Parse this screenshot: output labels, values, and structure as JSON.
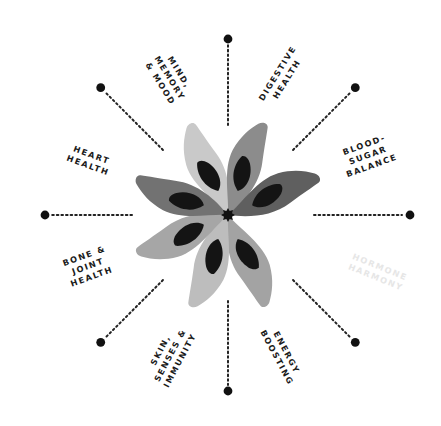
{
  "diagram": {
    "center": [
      228,
      215
    ],
    "spokes": [
      {
        "id": "digestive",
        "angle": -90,
        "dot_r": 176,
        "line_from": 90,
        "line_to": 170
      },
      {
        "id": "blood-sugar",
        "angle": -45,
        "dot_r": 180,
        "line_from": 92,
        "line_to": 172
      },
      {
        "id": "hormone",
        "angle": 0,
        "dot_r": 182,
        "line_from": 86,
        "line_to": 174
      },
      {
        "id": "energy",
        "angle": 45,
        "dot_r": 180,
        "line_from": 92,
        "line_to": 172
      },
      {
        "id": "skin",
        "angle": 90,
        "dot_r": 176,
        "line_from": 86,
        "line_to": 170
      },
      {
        "id": "bone",
        "angle": 135,
        "dot_r": 180,
        "line_from": 92,
        "line_to": 172
      },
      {
        "id": "heart",
        "angle": 180,
        "dot_r": 183,
        "line_from": 96,
        "line_to": 176
      },
      {
        "id": "mind",
        "angle": -135,
        "dot_r": 180,
        "line_from": 92,
        "line_to": 172
      }
    ],
    "petals": [
      {
        "angle": -112,
        "color": "#c9c9c9"
      },
      {
        "angle": -68,
        "color": "#8c8c8c"
      },
      {
        "angle": -22,
        "color": "#5f5f5f"
      },
      {
        "angle": 68,
        "color": "#a3a3a3"
      },
      {
        "angle": 112,
        "color": "#bdbdbd"
      },
      {
        "angle": 158,
        "color": "#a6a6a6"
      },
      {
        "angle": -158,
        "color": "#727272"
      }
    ],
    "labels": [
      {
        "id": "mind",
        "lines": [
          "MIND,",
          "MEMORY",
          "& MOOD"
        ],
        "x": 170,
        "y": 78,
        "rotate": 58,
        "faded": false
      },
      {
        "id": "digestive",
        "lines": [
          "DIGESTIVE",
          "HEALTH"
        ],
        "x": 282,
        "y": 76,
        "rotate": -58,
        "faded": false
      },
      {
        "id": "blood-sugar",
        "lines": [
          "BLOOD-",
          "SUGAR",
          "BALANCE"
        ],
        "x": 368,
        "y": 155,
        "rotate": -20,
        "faded": false
      },
      {
        "id": "hormone",
        "lines": [
          "HORMONE",
          "HARMONY"
        ],
        "x": 378,
        "y": 272,
        "rotate": 22,
        "faded": true
      },
      {
        "id": "energy",
        "lines": [
          "ENERGY",
          "BOOSTING"
        ],
        "x": 282,
        "y": 355,
        "rotate": 62,
        "faded": false
      },
      {
        "id": "skin",
        "lines": [
          "SKIN,",
          "SENSES &",
          "IMMUNITY"
        ],
        "x": 170,
        "y": 355,
        "rotate": -62,
        "faded": false
      },
      {
        "id": "bone",
        "lines": [
          "BONE &",
          "JOINT",
          "HEALTH"
        ],
        "x": 88,
        "y": 266,
        "rotate": -20,
        "faded": false
      },
      {
        "id": "heart",
        "lines": [
          "HEART",
          "HEALTH"
        ],
        "x": 90,
        "y": 160,
        "rotate": 20,
        "faded": false
      }
    ],
    "colors": {
      "dot": "#111111",
      "leaf_spot": "#141414",
      "center_star": "#111111",
      "line": "#222222"
    }
  }
}
